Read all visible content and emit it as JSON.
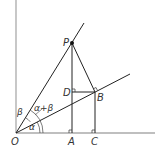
{
  "diagram": {
    "type": "geometry",
    "colors": {
      "axis": "#aaaaaa",
      "line": "#222222",
      "label": "#333333"
    },
    "points": {
      "O": {
        "label": "O",
        "x": 16,
        "y": 133
      },
      "P": {
        "label": "P",
        "x": 72,
        "y": 43
      },
      "A": {
        "label": "A",
        "x": 72,
        "y": 133
      },
      "B": {
        "label": "B",
        "x": 95,
        "y": 92
      },
      "C": {
        "label": "C",
        "x": 95,
        "y": 133
      },
      "D": {
        "label": "D",
        "x": 72,
        "y": 92
      }
    },
    "angles": {
      "alpha": "α",
      "beta": "β",
      "alpha_plus_beta": "α+β"
    },
    "caption": ""
  }
}
